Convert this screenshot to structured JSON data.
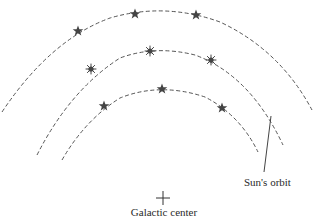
{
  "diagram": {
    "type": "galactic-orbits",
    "labels": {
      "center": "Galactic center",
      "sun_orbit": "Sun's orbit"
    },
    "colors": {
      "line": "#555555",
      "star": "#444444",
      "text": "#2a2a2a"
    },
    "center_marker": {
      "x": 163,
      "y": 198,
      "glyph": "plus-icon"
    },
    "orbits": [
      {
        "name": "outer",
        "path": "M 2 112 Q 50 40 110 18 Q 165 2 220 22 Q 280 50 312 110",
        "stars": [
          {
            "x": 78,
            "y": 31,
            "kind": "star-icon"
          },
          {
            "x": 135,
            "y": 14,
            "kind": "star-icon"
          },
          {
            "x": 196,
            "y": 15,
            "kind": "star-icon"
          }
        ]
      },
      {
        "name": "middle",
        "path": "M 37 155 Q 70 90 120 58 Q 155 45 195 55 Q 250 75 283 145",
        "stars": [
          {
            "x": 91,
            "y": 69,
            "kind": "burst-star-icon"
          },
          {
            "x": 150,
            "y": 51,
            "kind": "burst-star-icon"
          },
          {
            "x": 211,
            "y": 60,
            "kind": "burst-star-icon"
          }
        ]
      },
      {
        "name": "inner",
        "path": "M 62 160 Q 85 120 120 98 Q 160 82 205 97 Q 240 115 258 152",
        "stars": [
          {
            "x": 104,
            "y": 106,
            "kind": "star-icon"
          },
          {
            "x": 162,
            "y": 89,
            "kind": "star-icon"
          },
          {
            "x": 222,
            "y": 108,
            "kind": "star-icon"
          }
        ]
      }
    ],
    "sun_pointer": {
      "x1": 271,
      "y1": 116,
      "x2": 264,
      "y2": 172
    }
  }
}
